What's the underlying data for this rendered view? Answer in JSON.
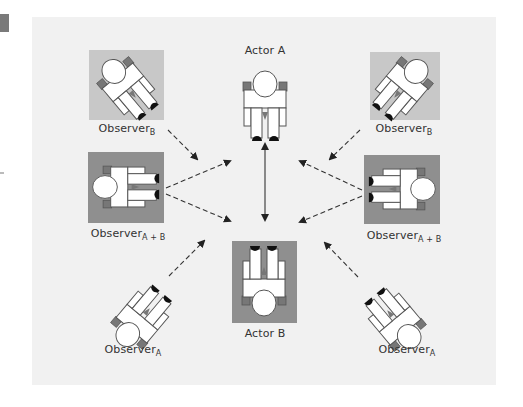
{
  "figure": {
    "type": "observation-setup-diagram",
    "colors": {
      "panel_bg": "#f1f1f1",
      "light_square": "#c8c8c8",
      "dark_square": "#8f8f8f",
      "figure_fill": "#ffffff",
      "figure_stroke": "#555555",
      "shoulder": "#777777",
      "shoe": "#111111",
      "arrow": "#333333"
    }
  },
  "labels": {
    "actor_a": "Actor A",
    "actor_b": "Actor B",
    "observer_base": "Observer",
    "observer_b_top_left_sub": "B",
    "observer_b_top_right_sub": "B",
    "observer_ab_left_sub": "A + B",
    "observer_ab_right_sub": "A + B",
    "observer_a_bottom_left_sub": "A",
    "observer_a_bottom_right_sub": "A"
  },
  "icons": {
    "person": "top-down-person-figure",
    "dashed_arrow": "dashed-arrow",
    "double_arrow": "solid-double-headed-arrow"
  }
}
